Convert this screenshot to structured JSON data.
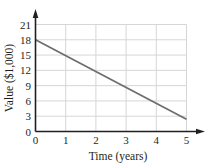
{
  "chart_data": {
    "type": "line",
    "title": "",
    "xlabel": "Time (years)",
    "ylabel": "Value ($1,000)",
    "xlim": [
      0,
      5
    ],
    "ylim": [
      0,
      21
    ],
    "x_ticks": [
      "0",
      "1",
      "2",
      "3",
      "4",
      "5"
    ],
    "y_ticks": [
      "0",
      "3",
      "6",
      "9",
      "12",
      "15",
      "18",
      "21"
    ],
    "grid": true,
    "legend": null,
    "series": [
      {
        "name": "Value",
        "x": [
          0,
          5
        ],
        "y": [
          18,
          2.4
        ],
        "color": "#6d6e71"
      }
    ]
  },
  "colors": {
    "axis": "#231f20",
    "grid": "#d6d6d6",
    "line": "#6d6e71"
  }
}
